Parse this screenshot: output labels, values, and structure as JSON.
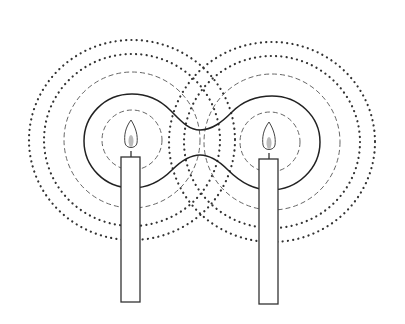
{
  "diagram": {
    "colors": {
      "background": "#ffffff",
      "line": "#222222",
      "dashed": "#666666",
      "dotted": "#333333"
    },
    "candles": [
      {
        "id": "left",
        "center": [
          132,
          140
        ],
        "body": {
          "x": 121,
          "y": 157,
          "w": 19,
          "h": 145
        }
      },
      {
        "id": "right",
        "center": [
          270,
          142
        ],
        "body": {
          "x": 259,
          "y": 159,
          "w": 19,
          "h": 145
        }
      }
    ],
    "rings": {
      "inner_dashed_radius": 30,
      "solid_lobe_radius": 48,
      "outer_dashed_radius": 68,
      "dotted_radii": [
        [
          86,
          72
        ],
        [
          103,
          88
        ]
      ]
    }
  }
}
